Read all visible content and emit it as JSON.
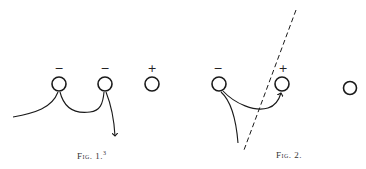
{
  "figures": [
    {
      "id": "fig1",
      "caption": "Fig. 1.",
      "caption_sup": "3",
      "charges": [
        {
          "sign": "−",
          "x": 59,
          "y": 84
        },
        {
          "sign": "−",
          "x": 105,
          "y": 84
        },
        {
          "sign": "+",
          "x": 152,
          "y": 84
        }
      ]
    },
    {
      "id": "fig2",
      "caption": "Fig. 2.",
      "charges": [
        {
          "sign": "−",
          "x": 219,
          "y": 84
        },
        {
          "sign": "+",
          "x": 282,
          "y": 84
        },
        {
          "sign": "",
          "x": 350,
          "y": 88
        }
      ]
    }
  ],
  "colors": {
    "ink": "#1a1a1a",
    "background": "#ffffff"
  }
}
